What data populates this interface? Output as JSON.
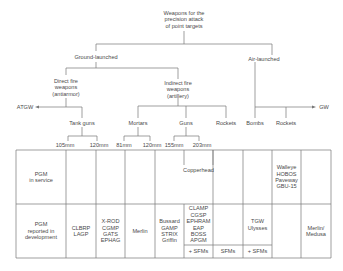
{
  "tree": {
    "root": [
      "Weapons for the",
      "precision attack",
      "of point targets"
    ],
    "ground": "Ground-launched",
    "air": "Air-launched",
    "direct": [
      "Direct fire",
      "weapons",
      "(antiarmor)"
    ],
    "indirect": [
      "Indirect fire",
      "weapons",
      "(artillery)"
    ],
    "atgw": "ATGW",
    "gw": "GW",
    "tank_guns": "Tank guns",
    "mortars": "Mortars",
    "guns": "Guns",
    "rockets_ground": "Rockets",
    "bombs": "Bombs",
    "rockets_air": "Rockets",
    "calibers": [
      "105mm",
      "120mm",
      "81mm",
      "120mm",
      "155mm",
      "203mm"
    ]
  },
  "table": {
    "row1_label": [
      "PGM",
      "in service"
    ],
    "row2_label": [
      "PGM",
      "reported in",
      "development"
    ],
    "copperhead": "Copperhead",
    "air_in_service": [
      "Walleye",
      "HOBOS",
      "Paveway",
      "GBU-15"
    ],
    "dev": {
      "tank105": [
        "CLBRP",
        "LAGP"
      ],
      "tank120": [
        "X-ROD",
        "CGMP",
        "GATS",
        "EPHAG"
      ],
      "mortar81": [
        "Merlin"
      ],
      "mortar120": [
        "Bussard",
        "GAMP",
        "STRIX",
        "Griffin"
      ],
      "gun155": [
        "CLAMP",
        "CGSP",
        "EPHRAM",
        "EAP",
        "BOSS",
        "APGM"
      ],
      "rockets": [
        "TGW",
        "Ulysses"
      ],
      "air_rockets": [
        "Merlin/",
        "Medusa"
      ]
    },
    "sfm": [
      "+ SFMs",
      "SFMs",
      "+ SFMs"
    ]
  }
}
